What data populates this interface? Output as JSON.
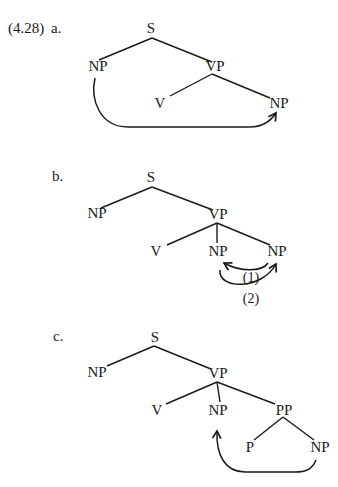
{
  "example_number": "(4.28)",
  "diagrams": [
    {
      "id": "a",
      "label": "a.",
      "nodes": {
        "S": "S",
        "NP_subj": "NP",
        "VP": "VP",
        "V": "V",
        "NP_obj": "NP"
      },
      "movement": "NP_subj -> NP_obj"
    },
    {
      "id": "b",
      "label": "b.",
      "nodes": {
        "S": "S",
        "NP_subj": "NP",
        "VP": "VP",
        "V": "V",
        "NP_1": "NP",
        "NP_2": "NP"
      },
      "arrows": [
        {
          "label": "(1)",
          "from": "NP_2",
          "to": "NP_1"
        },
        {
          "label": "(2)",
          "from": "NP_1",
          "to": "NP_2"
        }
      ]
    },
    {
      "id": "c",
      "label": "c.",
      "nodes": {
        "S": "S",
        "NP_subj": "NP",
        "VP": "VP",
        "V": "V",
        "NP_obj": "NP",
        "PP": "PP",
        "P": "P",
        "NP_pobj": "NP"
      },
      "movement": "NP_pobj -> NP_obj"
    }
  ]
}
